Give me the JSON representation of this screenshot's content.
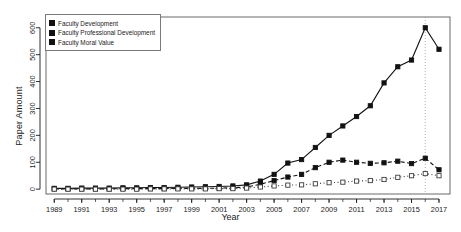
{
  "chart_data": {
    "type": "line",
    "title": "",
    "xlabel": "Year",
    "ylabel": "Paper Amount",
    "xlim": [
      1988.4,
      2017.8
    ],
    "ylim": [
      -18,
      640
    ],
    "yticks": [
      0,
      100,
      200,
      300,
      400,
      500,
      600
    ],
    "xticks": [
      1989,
      1991,
      1993,
      1995,
      1997,
      1999,
      2001,
      2003,
      2005,
      2007,
      2009,
      2011,
      2013,
      2015,
      2017
    ],
    "grid": false,
    "legend_position": "top-left",
    "annotations": [
      {
        "type": "vertical-dotted-line",
        "x": 2016,
        "label": ""
      }
    ],
    "x": [
      1989,
      1990,
      1991,
      1992,
      1993,
      1994,
      1995,
      1996,
      1997,
      1998,
      1999,
      2000,
      2001,
      2002,
      2003,
      2004,
      2005,
      2006,
      2007,
      2008,
      2009,
      2010,
      2011,
      2012,
      2013,
      2014,
      2015,
      2016,
      2017
    ],
    "series": [
      {
        "name": "Faculty Development",
        "marker": "filled-square",
        "line": "solid",
        "color": "#121212",
        "values": [
          3,
          3,
          4,
          4,
          4,
          5,
          5,
          6,
          6,
          7,
          8,
          9,
          10,
          12,
          16,
          30,
          55,
          97,
          110,
          155,
          200,
          235,
          270,
          310,
          395,
          455,
          480,
          600,
          520
        ]
      },
      {
        "name": "Faculty Professional Development",
        "marker": "filled-square",
        "line": "dashed",
        "color": "#121212",
        "values": [
          1,
          1,
          1,
          1,
          1,
          2,
          2,
          2,
          2,
          3,
          3,
          3,
          4,
          5,
          8,
          18,
          32,
          45,
          55,
          80,
          100,
          108,
          100,
          96,
          98,
          104,
          95,
          115,
          72
        ]
      },
      {
        "name": "Faculty Moral Value",
        "marker": "open-square",
        "line": "dotted",
        "color": "#3d3d3d",
        "values": [
          0,
          0,
          0,
          0,
          0,
          0,
          0,
          1,
          1,
          1,
          1,
          1,
          2,
          2,
          4,
          8,
          12,
          15,
          16,
          20,
          24,
          26,
          30,
          32,
          36,
          44,
          50,
          58,
          50
        ]
      }
    ]
  },
  "legend": {
    "items": [
      {
        "label": "Faculty Development"
      },
      {
        "label": "Faculty Professional Development"
      },
      {
        "label": "Faculty Moral Value"
      }
    ]
  },
  "axes": {
    "y_title": "Paper Amount",
    "x_title": "Year"
  }
}
